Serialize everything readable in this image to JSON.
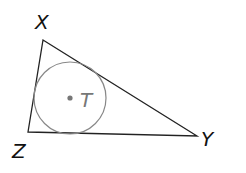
{
  "diagram": {
    "type": "triangle with inscribed circle",
    "vertices": [
      {
        "label": "X",
        "x": 43,
        "y": 40
      },
      {
        "label": "Y",
        "x": 197,
        "y": 136
      },
      {
        "label": "Z",
        "x": 28,
        "y": 132
      }
    ],
    "incircle": {
      "center_label": "T",
      "cx": 70,
      "cy": 98,
      "r": 36
    },
    "colors": {
      "triangle": "#222222",
      "circle": "#888888",
      "center_point": "#777777",
      "label": "#111111",
      "center_label": "#777777"
    }
  }
}
